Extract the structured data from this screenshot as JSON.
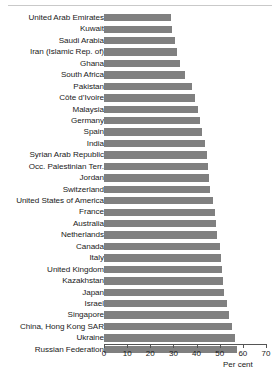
{
  "chart_data": {
    "type": "bar",
    "orientation": "horizontal",
    "title": "",
    "xlabel": "Per cent",
    "ylabel": "",
    "xlim": [
      0,
      70
    ],
    "xticks": [
      0,
      10,
      20,
      30,
      40,
      50,
      60,
      70
    ],
    "grid": false,
    "legend": null,
    "bar_color": "#808080",
    "categories": [
      "United Arab Emirates",
      "Kuwait",
      "Saudi Arabia",
      "Iran (Islamic Rep. of)",
      "Ghana",
      "South Africa",
      "Pakistan",
      "Côte d’Ivoire",
      "Malaysia",
      "Germany",
      "Spain",
      "India",
      "Syrian Arab Republic",
      "Occ. Palestinian Terr.",
      "Jordan",
      "Switzerland",
      "United States of America",
      "France",
      "Australia",
      "Netherlands",
      "Canada",
      "Italy",
      "United Kingdom",
      "Kazakhstan",
      "Japan",
      "Israel",
      "Singapore",
      "China, Hong Kong SAR",
      "Ukraine",
      "Russian Federation"
    ],
    "values": [
      29.0,
      29.2,
      30.5,
      31.5,
      33.0,
      35.0,
      38.0,
      39.5,
      40.5,
      41.5,
      42.5,
      43.5,
      44.5,
      45.0,
      45.5,
      46.0,
      47.0,
      48.0,
      48.5,
      49.0,
      50.0,
      50.5,
      51.0,
      51.5,
      52.0,
      53.0,
      54.0,
      55.5,
      56.5,
      57.5
    ]
  },
  "axis": {
    "unit_label": "Per cent"
  }
}
